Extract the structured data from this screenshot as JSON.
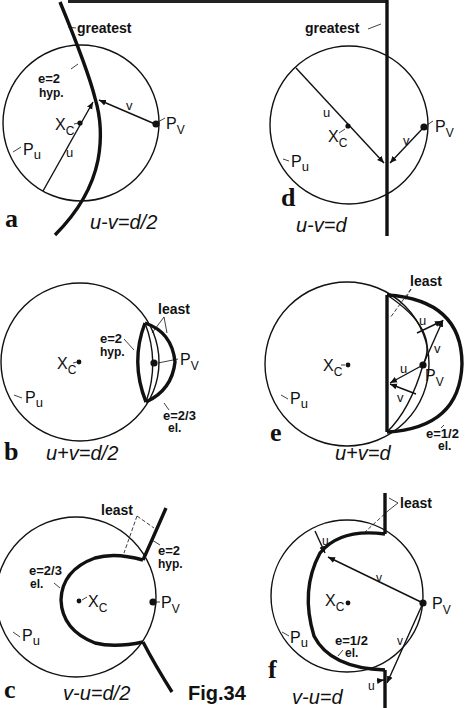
{
  "figure": {
    "caption": "Fig.34",
    "header_partial": "(cut-off heading text at top edge)"
  },
  "panels": {
    "a": {
      "letter": "a",
      "equation": "u-v=d/2",
      "curve_label": "greatest",
      "eccentricity": "e=2",
      "conic_type": "hyp.",
      "center_label": "X",
      "center_sub": "C",
      "pu_label": "P",
      "pu_sub": "u",
      "pv_label": "P",
      "pv_sub": "V",
      "u_label": "u",
      "v_label": "v"
    },
    "d": {
      "letter": "d",
      "equation": "u-v=d",
      "curve_label": "greatest",
      "center_label": "X",
      "center_sub": "C",
      "pu_label": "P",
      "pu_sub": "u",
      "pv_label": "P",
      "pv_sub": "V",
      "u_label": "u",
      "v_label": "v"
    },
    "b": {
      "letter": "b",
      "equation": "u+v=d/2",
      "curve_label": "least",
      "hyp_eccentricity": "e=2",
      "hyp_type": "hyp.",
      "el_eccentricity": "e=2/3",
      "el_type": "el.",
      "center_label": "X",
      "center_sub": "C",
      "pu_label": "P",
      "pu_sub": "u",
      "pv_label": "P",
      "pv_sub": "V"
    },
    "e": {
      "letter": "e",
      "equation": "u+v=d",
      "curve_label": "least",
      "el_eccentricity": "e=1/2",
      "el_type": "el.",
      "center_label": "X",
      "center_sub": "C",
      "pu_label": "P",
      "pu_sub": "u",
      "pv_label": "P",
      "pv_sub": "V",
      "u_label": "u",
      "v_label": "v"
    },
    "c": {
      "letter": "c",
      "equation": "v-u=d/2",
      "curve_label": "least",
      "hyp_eccentricity": "e=2",
      "hyp_type": "hyp.",
      "el_eccentricity": "e=2/3",
      "el_type": "el.",
      "center_label": "X",
      "center_sub": "C",
      "pu_label": "P",
      "pu_sub": "u",
      "pv_label": "P",
      "pv_sub": "V"
    },
    "f": {
      "letter": "f",
      "equation": "v-u=d",
      "curve_label": "least",
      "el_eccentricity": "e=1/2",
      "el_type": "el.",
      "center_label": "X",
      "center_sub": "C",
      "pu_label": "P",
      "pu_sub": "u",
      "pv_label": "P",
      "pv_sub": "V",
      "u_label": "u",
      "v_label": "v"
    }
  },
  "colors": {
    "ink": "#111111",
    "background": "#ffffff"
  }
}
